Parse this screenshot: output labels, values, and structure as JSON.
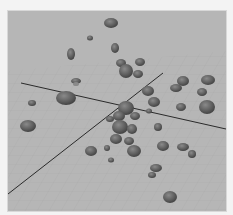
{
  "viewport": {
    "label": "3D viewport - scattered rocks",
    "background_color": "#b4b4b4",
    "grid_color": "#a8a8a8",
    "axis_color": "#2a2a2a",
    "rock_color": "#6a6a6a"
  }
}
